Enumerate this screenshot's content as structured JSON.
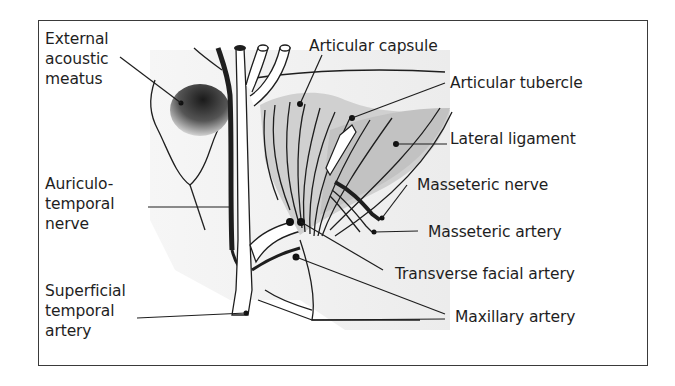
{
  "colors": {
    "ink": "#1e1e1e",
    "frame": "#3a3a3a",
    "light_fill": "#efefef",
    "capsule_fill": "#cfcfcf",
    "ligament_fill": "#c4c4c4",
    "meatus_dark": "#2a2a2a"
  },
  "labels": {
    "external_acoustic_meatus": [
      "External",
      "acoustic",
      "meatus"
    ],
    "auriculotemporal_nerve": [
      "Auriculo-",
      "temporal",
      "nerve"
    ],
    "superficial_temporal_artery": [
      "Superficial",
      "temporal",
      "artery"
    ],
    "articular_capsule": "Articular capsule",
    "articular_tubercle": "Articular tubercle",
    "lateral_ligament": "Lateral ligament",
    "masseteric_nerve": "Masseteric nerve",
    "masseteric_artery": "Masseteric artery",
    "transverse_facial_artery": "Transverse facial artery",
    "maxillary_artery": "Maxillary artery"
  }
}
